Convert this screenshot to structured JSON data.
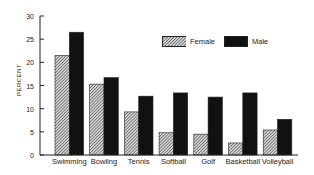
{
  "chart_data": {
    "type": "bar",
    "title": "",
    "xlabel": "",
    "ylabel": "PERCENT",
    "ylim": [
      0,
      30
    ],
    "yticks": [
      0,
      5,
      10,
      15,
      20,
      25,
      30
    ],
    "grid": false,
    "legend_position": "upper right",
    "categories": [
      "Swimming",
      "Bowling",
      "Tennis",
      "Softball",
      "Golf",
      "Basketball",
      "Volleyball"
    ],
    "series": [
      {
        "name": "Female",
        "pattern": "hatched",
        "color": "#888888",
        "values": [
          21.5,
          15.3,
          9.3,
          4.8,
          4.5,
          2.6,
          5.4
        ]
      },
      {
        "name": "Male",
        "pattern": "solid",
        "color": "#111111",
        "values": [
          26.5,
          16.7,
          12.7,
          13.4,
          12.5,
          13.4,
          7.7
        ]
      }
    ]
  },
  "legend": {
    "female": "Female",
    "male": "Male"
  },
  "axis": {
    "ylabel": "PERCENT"
  }
}
